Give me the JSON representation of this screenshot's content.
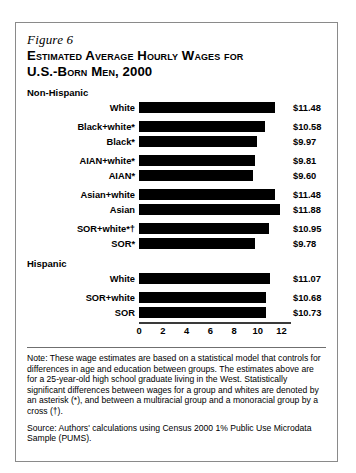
{
  "figure": {
    "label": "Figure 6",
    "title": "Estimated Average Hourly Wages for\nU.S.-Born Men, 2000"
  },
  "groups": {
    "non_hispanic": "Non-Hispanic",
    "hispanic": "Hispanic"
  },
  "notes": {
    "note": "Note: These wage estimates are based on a statistical model that controls for differences in age and education between groups. The estimates above are for a 25-year-old high school graduate living in the West. Statistically significant differences between wages for a group and whites are denoted by an asterisk (*), and between a multiracial group and a monoracial group by a cross (†).",
    "source": "Source: Authors' calculations using Census 2000 1% Public Use Microdata Sample (PUMS)."
  },
  "chart_data": {
    "type": "bar",
    "orientation": "horizontal",
    "title": "Estimated Average Hourly Wages for U.S.-Born Men, 2000",
    "xlabel": "",
    "ylabel": "",
    "xlim": [
      0,
      12.8
    ],
    "ticks": [
      0,
      2,
      4,
      6,
      8,
      10,
      12
    ],
    "tick_labels": [
      "0",
      "2",
      "4",
      "6",
      "8",
      "10",
      "12"
    ],
    "grid": false,
    "legend": false,
    "bar_color": "#000000",
    "categories": [
      "White",
      "Black+white*",
      "Black*",
      "AIAN+white*",
      "AIAN*",
      "Asian+white",
      "Asian",
      "SOR+white*†",
      "SOR*",
      "White",
      "SOR+white",
      "SOR"
    ],
    "values": [
      11.48,
      10.58,
      9.97,
      9.81,
      9.6,
      11.48,
      11.88,
      10.95,
      9.78,
      11.07,
      10.68,
      10.73
    ],
    "value_labels": [
      "$11.48",
      "$10.58",
      "$9.97",
      "$9.81",
      "$9.60",
      "$11.48",
      "$11.88",
      "$10.95",
      "$9.78",
      "$11.07",
      "$10.68",
      "$10.73"
    ],
    "sections": [
      {
        "name": "Non-Hispanic",
        "bars": [
          {
            "label": "White",
            "value": 11.48,
            "value_label": "$11.48",
            "gap_before": false
          },
          {
            "label": "Black+white*",
            "value": 10.58,
            "value_label": "$10.58",
            "gap_before": true
          },
          {
            "label": "Black*",
            "value": 9.97,
            "value_label": "$9.97",
            "gap_before": false
          },
          {
            "label": "AIAN+white*",
            "value": 9.81,
            "value_label": "$9.81",
            "gap_before": true
          },
          {
            "label": "AIAN*",
            "value": 9.6,
            "value_label": "$9.60",
            "gap_before": false
          },
          {
            "label": "Asian+white",
            "value": 11.48,
            "value_label": "$11.48",
            "gap_before": true
          },
          {
            "label": "Asian",
            "value": 11.88,
            "value_label": "$11.88",
            "gap_before": false
          },
          {
            "label": "SOR+white*†",
            "value": 10.95,
            "value_label": "$10.95",
            "gap_before": true
          },
          {
            "label": "SOR*",
            "value": 9.78,
            "value_label": "$9.78",
            "gap_before": false
          }
        ]
      },
      {
        "name": "Hispanic",
        "bars": [
          {
            "label": "White",
            "value": 11.07,
            "value_label": "$11.07",
            "gap_before": false
          },
          {
            "label": "SOR+white",
            "value": 10.68,
            "value_label": "$10.68",
            "gap_before": true
          },
          {
            "label": "SOR",
            "value": 10.73,
            "value_label": "$10.73",
            "gap_before": false
          }
        ]
      }
    ]
  }
}
